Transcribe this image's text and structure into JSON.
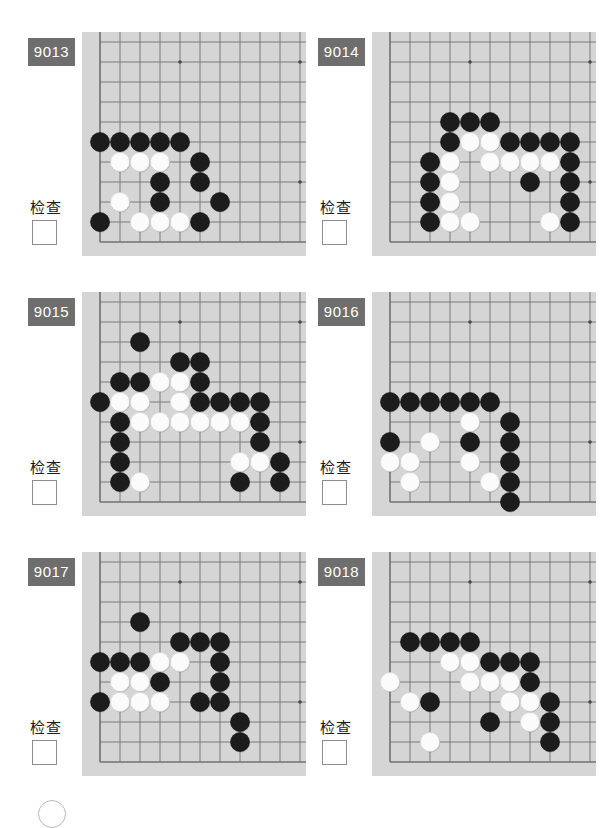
{
  "page": {
    "background": "#ffffff",
    "columns": 2,
    "rows": 3
  },
  "style": {
    "badge_bg": "#6e6e6e",
    "badge_fg": "#ffffff",
    "board_bg": "#d5d5d5",
    "grid_line": "#707070",
    "edge_line": "#5a5a5a",
    "black_stone": "#1c1c1c",
    "white_stone": "#fbfbfb",
    "checkbox_border": "#8d8d8d"
  },
  "board_geometry": {
    "cols": 11,
    "rows": 11,
    "spacing": 20,
    "origin_x": 18,
    "origin_y": 10,
    "stone_radius": 9.5,
    "star_points": [
      [
        4,
        1
      ],
      [
        10,
        1
      ],
      [
        10,
        7
      ]
    ]
  },
  "labels": {
    "check_text": "检查"
  },
  "puzzles": [
    {
      "id": "9013",
      "label": "9013",
      "check_label": "检查",
      "checkbox_checked": false,
      "stones": [
        {
          "c": 0,
          "r": 5,
          "color": "black"
        },
        {
          "c": 1,
          "r": 5,
          "color": "black"
        },
        {
          "c": 2,
          "r": 5,
          "color": "black"
        },
        {
          "c": 3,
          "r": 5,
          "color": "black"
        },
        {
          "c": 4,
          "r": 5,
          "color": "black"
        },
        {
          "c": 1,
          "r": 6,
          "color": "white"
        },
        {
          "c": 2,
          "r": 6,
          "color": "white"
        },
        {
          "c": 3,
          "r": 6,
          "color": "white"
        },
        {
          "c": 5,
          "r": 6,
          "color": "black"
        },
        {
          "c": 3,
          "r": 7,
          "color": "black"
        },
        {
          "c": 5,
          "r": 7,
          "color": "black"
        },
        {
          "c": 1,
          "r": 8,
          "color": "white"
        },
        {
          "c": 3,
          "r": 8,
          "color": "black"
        },
        {
          "c": 6,
          "r": 8,
          "color": "black"
        },
        {
          "c": 0,
          "r": 9,
          "color": "black"
        },
        {
          "c": 2,
          "r": 9,
          "color": "white"
        },
        {
          "c": 3,
          "r": 9,
          "color": "white"
        },
        {
          "c": 4,
          "r": 9,
          "color": "white"
        },
        {
          "c": 5,
          "r": 9,
          "color": "black"
        }
      ]
    },
    {
      "id": "9014",
      "label": "9014",
      "check_label": "检查",
      "checkbox_checked": false,
      "stones": [
        {
          "c": 3,
          "r": 4,
          "color": "black"
        },
        {
          "c": 4,
          "r": 4,
          "color": "black"
        },
        {
          "c": 5,
          "r": 4,
          "color": "black"
        },
        {
          "c": 3,
          "r": 5,
          "color": "black"
        },
        {
          "c": 4,
          "r": 5,
          "color": "white"
        },
        {
          "c": 5,
          "r": 5,
          "color": "white"
        },
        {
          "c": 6,
          "r": 5,
          "color": "black"
        },
        {
          "c": 7,
          "r": 5,
          "color": "black"
        },
        {
          "c": 8,
          "r": 5,
          "color": "black"
        },
        {
          "c": 9,
          "r": 5,
          "color": "black"
        },
        {
          "c": 2,
          "r": 6,
          "color": "black"
        },
        {
          "c": 3,
          "r": 6,
          "color": "white"
        },
        {
          "c": 5,
          "r": 6,
          "color": "white"
        },
        {
          "c": 6,
          "r": 6,
          "color": "white"
        },
        {
          "c": 7,
          "r": 6,
          "color": "white"
        },
        {
          "c": 8,
          "r": 6,
          "color": "white"
        },
        {
          "c": 9,
          "r": 6,
          "color": "black"
        },
        {
          "c": 2,
          "r": 7,
          "color": "black"
        },
        {
          "c": 3,
          "r": 7,
          "color": "white"
        },
        {
          "c": 7,
          "r": 7,
          "color": "black"
        },
        {
          "c": 9,
          "r": 7,
          "color": "black"
        },
        {
          "c": 2,
          "r": 8,
          "color": "black"
        },
        {
          "c": 3,
          "r": 8,
          "color": "white"
        },
        {
          "c": 9,
          "r": 8,
          "color": "black"
        },
        {
          "c": 2,
          "r": 9,
          "color": "black"
        },
        {
          "c": 3,
          "r": 9,
          "color": "white"
        },
        {
          "c": 4,
          "r": 9,
          "color": "white"
        },
        {
          "c": 8,
          "r": 9,
          "color": "white"
        },
        {
          "c": 9,
          "r": 9,
          "color": "black"
        }
      ]
    },
    {
      "id": "9015",
      "label": "9015",
      "check_label": "检查",
      "checkbox_checked": false,
      "stones": [
        {
          "c": 2,
          "r": 2,
          "color": "black"
        },
        {
          "c": 4,
          "r": 3,
          "color": "black"
        },
        {
          "c": 5,
          "r": 3,
          "color": "black"
        },
        {
          "c": 1,
          "r": 4,
          "color": "black"
        },
        {
          "c": 2,
          "r": 4,
          "color": "black"
        },
        {
          "c": 3,
          "r": 4,
          "color": "white"
        },
        {
          "c": 4,
          "r": 4,
          "color": "white"
        },
        {
          "c": 5,
          "r": 4,
          "color": "black"
        },
        {
          "c": 0,
          "r": 5,
          "color": "black"
        },
        {
          "c": 1,
          "r": 5,
          "color": "white"
        },
        {
          "c": 2,
          "r": 5,
          "color": "white"
        },
        {
          "c": 4,
          "r": 5,
          "color": "white"
        },
        {
          "c": 5,
          "r": 5,
          "color": "black"
        },
        {
          "c": 6,
          "r": 5,
          "color": "black"
        },
        {
          "c": 7,
          "r": 5,
          "color": "black"
        },
        {
          "c": 8,
          "r": 5,
          "color": "black"
        },
        {
          "c": 1,
          "r": 6,
          "color": "black"
        },
        {
          "c": 2,
          "r": 6,
          "color": "white"
        },
        {
          "c": 3,
          "r": 6,
          "color": "white"
        },
        {
          "c": 4,
          "r": 6,
          "color": "white"
        },
        {
          "c": 5,
          "r": 6,
          "color": "white"
        },
        {
          "c": 6,
          "r": 6,
          "color": "white"
        },
        {
          "c": 7,
          "r": 6,
          "color": "white"
        },
        {
          "c": 8,
          "r": 6,
          "color": "black"
        },
        {
          "c": 1,
          "r": 7,
          "color": "black"
        },
        {
          "c": 8,
          "r": 7,
          "color": "black"
        },
        {
          "c": 1,
          "r": 8,
          "color": "black"
        },
        {
          "c": 7,
          "r": 8,
          "color": "white"
        },
        {
          "c": 8,
          "r": 8,
          "color": "white"
        },
        {
          "c": 9,
          "r": 8,
          "color": "black"
        },
        {
          "c": 1,
          "r": 9,
          "color": "black"
        },
        {
          "c": 2,
          "r": 9,
          "color": "white"
        },
        {
          "c": 7,
          "r": 9,
          "color": "black"
        },
        {
          "c": 9,
          "r": 9,
          "color": "black"
        }
      ]
    },
    {
      "id": "9016",
      "label": "9016",
      "check_label": "检查",
      "checkbox_checked": false,
      "stones": [
        {
          "c": 0,
          "r": 5,
          "color": "black"
        },
        {
          "c": 1,
          "r": 5,
          "color": "black"
        },
        {
          "c": 2,
          "r": 5,
          "color": "black"
        },
        {
          "c": 3,
          "r": 5,
          "color": "black"
        },
        {
          "c": 4,
          "r": 5,
          "color": "black"
        },
        {
          "c": 5,
          "r": 5,
          "color": "black"
        },
        {
          "c": 4,
          "r": 6,
          "color": "white"
        },
        {
          "c": 6,
          "r": 6,
          "color": "black"
        },
        {
          "c": 0,
          "r": 7,
          "color": "black"
        },
        {
          "c": 2,
          "r": 7,
          "color": "white"
        },
        {
          "c": 4,
          "r": 7,
          "color": "black"
        },
        {
          "c": 6,
          "r": 7,
          "color": "black"
        },
        {
          "c": 0,
          "r": 8,
          "color": "white"
        },
        {
          "c": 1,
          "r": 8,
          "color": "white"
        },
        {
          "c": 4,
          "r": 8,
          "color": "white"
        },
        {
          "c": 6,
          "r": 8,
          "color": "black"
        },
        {
          "c": 1,
          "r": 9,
          "color": "white"
        },
        {
          "c": 5,
          "r": 9,
          "color": "white"
        },
        {
          "c": 6,
          "r": 9,
          "color": "black"
        },
        {
          "c": 6,
          "r": 10,
          "color": "black"
        }
      ]
    },
    {
      "id": "9017",
      "label": "9017",
      "check_label": "检查",
      "checkbox_checked": false,
      "stones": [
        {
          "c": 2,
          "r": 3,
          "color": "black"
        },
        {
          "c": 4,
          "r": 4,
          "color": "black"
        },
        {
          "c": 5,
          "r": 4,
          "color": "black"
        },
        {
          "c": 6,
          "r": 4,
          "color": "black"
        },
        {
          "c": 0,
          "r": 5,
          "color": "black"
        },
        {
          "c": 1,
          "r": 5,
          "color": "black"
        },
        {
          "c": 2,
          "r": 5,
          "color": "black"
        },
        {
          "c": 3,
          "r": 5,
          "color": "white"
        },
        {
          "c": 4,
          "r": 5,
          "color": "white"
        },
        {
          "c": 6,
          "r": 5,
          "color": "black"
        },
        {
          "c": 1,
          "r": 6,
          "color": "white"
        },
        {
          "c": 2,
          "r": 6,
          "color": "white"
        },
        {
          "c": 3,
          "r": 6,
          "color": "black"
        },
        {
          "c": 6,
          "r": 6,
          "color": "black"
        },
        {
          "c": 0,
          "r": 7,
          "color": "black"
        },
        {
          "c": 1,
          "r": 7,
          "color": "white"
        },
        {
          "c": 2,
          "r": 7,
          "color": "white"
        },
        {
          "c": 3,
          "r": 7,
          "color": "white"
        },
        {
          "c": 5,
          "r": 7,
          "color": "black"
        },
        {
          "c": 6,
          "r": 7,
          "color": "black"
        },
        {
          "c": 7,
          "r": 8,
          "color": "black"
        },
        {
          "c": 7,
          "r": 9,
          "color": "black"
        }
      ]
    },
    {
      "id": "9018",
      "label": "9018",
      "check_label": "检查",
      "checkbox_checked": false,
      "stones": [
        {
          "c": 1,
          "r": 4,
          "color": "black"
        },
        {
          "c": 2,
          "r": 4,
          "color": "black"
        },
        {
          "c": 3,
          "r": 4,
          "color": "black"
        },
        {
          "c": 4,
          "r": 4,
          "color": "black"
        },
        {
          "c": 3,
          "r": 5,
          "color": "white"
        },
        {
          "c": 4,
          "r": 5,
          "color": "white"
        },
        {
          "c": 5,
          "r": 5,
          "color": "black"
        },
        {
          "c": 6,
          "r": 5,
          "color": "black"
        },
        {
          "c": 7,
          "r": 5,
          "color": "black"
        },
        {
          "c": 0,
          "r": 6,
          "color": "white"
        },
        {
          "c": 4,
          "r": 6,
          "color": "white"
        },
        {
          "c": 5,
          "r": 6,
          "color": "white"
        },
        {
          "c": 6,
          "r": 6,
          "color": "white"
        },
        {
          "c": 7,
          "r": 6,
          "color": "black"
        },
        {
          "c": 1,
          "r": 7,
          "color": "white"
        },
        {
          "c": 2,
          "r": 7,
          "color": "black"
        },
        {
          "c": 6,
          "r": 7,
          "color": "white"
        },
        {
          "c": 7,
          "r": 7,
          "color": "white"
        },
        {
          "c": 8,
          "r": 7,
          "color": "black"
        },
        {
          "c": 5,
          "r": 8,
          "color": "black"
        },
        {
          "c": 7,
          "r": 8,
          "color": "white"
        },
        {
          "c": 8,
          "r": 8,
          "color": "black"
        },
        {
          "c": 2,
          "r": 9,
          "color": "white"
        },
        {
          "c": 8,
          "r": 9,
          "color": "black"
        }
      ]
    }
  ]
}
